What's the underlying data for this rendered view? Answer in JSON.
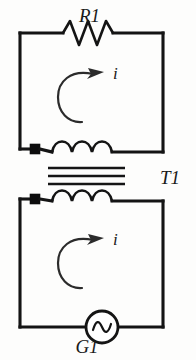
{
  "figure": {
    "kind": "transformer-circuit-schematic",
    "background_color": "#fdfdfc",
    "ink_color": "#141414"
  },
  "labels": {
    "resistor": "R1",
    "transformer": "T1",
    "source": "G1",
    "current_primary": "i",
    "current_secondary": "i"
  },
  "components": {
    "resistor": {
      "name": "R1",
      "symbol": "zigzag",
      "peaks": 3,
      "placement": "top-wire-of-primary-loop"
    },
    "transformer": {
      "name": "T1",
      "symbol": "two-coils-with-iron-core",
      "core_lines": 3,
      "primary_coil_humps": 3,
      "secondary_coil_humps": 3,
      "primary_terminal_marker": "filled-square",
      "secondary_terminal_marker": "filled-square"
    },
    "source": {
      "name": "G1",
      "symbol": "ac-source-circle-sine",
      "placement": "bottom-wire-of-secondary-loop"
    }
  },
  "annotations": {
    "primary_current": {
      "label": "i",
      "symbol": "curved-arrow",
      "direction": "clockwise"
    },
    "secondary_current": {
      "label": "i",
      "symbol": "curved-arrow",
      "direction": "clockwise"
    }
  }
}
